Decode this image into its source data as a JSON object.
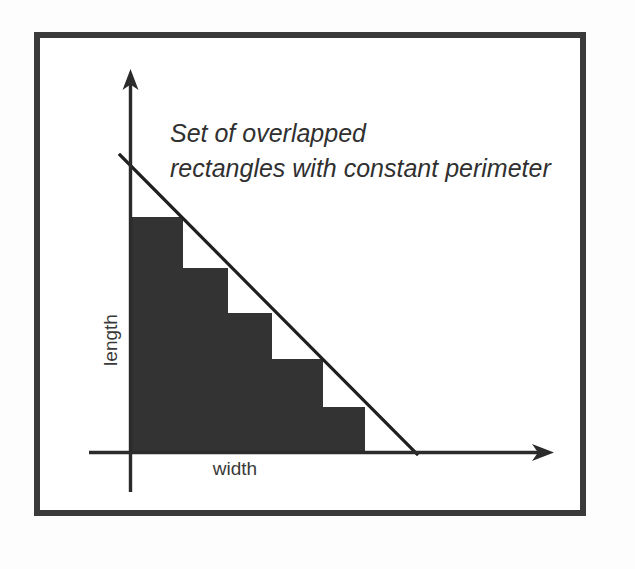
{
  "figure": {
    "frame": {
      "border_color": "#3a3a3a",
      "background_color": "#ffffff",
      "page_background": "#fdfdfd"
    },
    "annotation": {
      "line1": "Set of overlapped",
      "line2": "rectangles with constant perimeter",
      "style": "italic"
    },
    "axes": {
      "x_label": "width",
      "y_label": "length",
      "axis_color": "#2b2b2b",
      "x_arrow_icon": "arrow-right-icon",
      "y_arrow_icon": "arrow-up-icon"
    },
    "constraint_line": {
      "description": "constant perimeter line",
      "color": "#1f1f1f"
    }
  },
  "chart_data": {
    "type": "bar",
    "title": "Set of overlapped rectangles with constant perimeter",
    "xlabel": "width",
    "ylabel": "length",
    "grid": false,
    "legend": false,
    "xlim": [
      0,
      10
    ],
    "ylim": [
      0,
      10
    ],
    "note": "Five nested rectangles, each anchored at the origin, whose width + length is constant; their far corners lie on the straight constant-perimeter line.",
    "series": [
      {
        "name": "rectangles",
        "bar_color": "#333333",
        "categories": [
          "r1",
          "r2",
          "r3",
          "r4",
          "r5"
        ],
        "width_values": [
          1.2,
          2.3,
          3.3,
          4.6,
          5.5
        ],
        "length_values": [
          5.5,
          4.4,
          3.3,
          2.2,
          1.1
        ]
      }
    ],
    "constraint_line": {
      "name": "constant perimeter",
      "x": [
        -0.25,
        6.8
      ],
      "y": [
        6.9,
        0.0
      ],
      "color": "#1f1f1f"
    },
    "rectangles_px": [
      {
        "id": "r1",
        "x": 132,
        "y": 217,
        "w": 51,
        "h": 235
      },
      {
        "id": "r2",
        "x": 132,
        "y": 268,
        "w": 96,
        "h": 184
      },
      {
        "id": "r3",
        "x": 132,
        "y": 313,
        "w": 140,
        "h": 139
      },
      {
        "id": "r4",
        "x": 132,
        "y": 359,
        "w": 191,
        "h": 93
      },
      {
        "id": "r5",
        "x": 132,
        "y": 407,
        "w": 233,
        "h": 45
      }
    ]
  }
}
